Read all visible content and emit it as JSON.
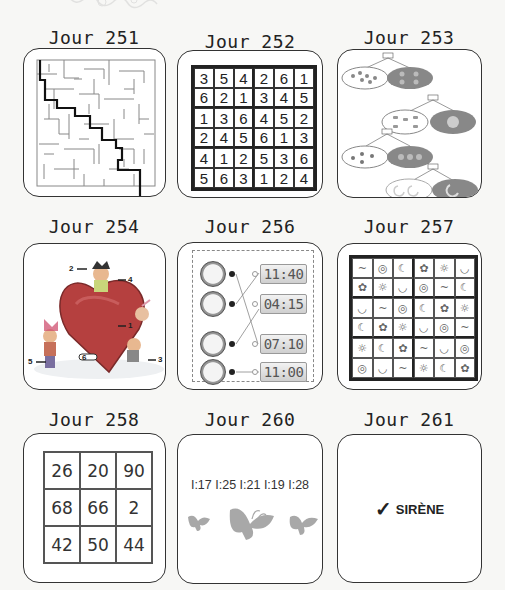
{
  "page": {
    "decoration": "swirl-ornament"
  },
  "cards": [
    {
      "title": "Jour 251",
      "type": "maze",
      "content": "maze-solution-path"
    },
    {
      "title": "Jour 252",
      "type": "sudoku",
      "grid": [
        [
          3,
          5,
          4,
          2,
          6,
          1
        ],
        [
          6,
          2,
          1,
          3,
          4,
          5
        ],
        [
          1,
          3,
          6,
          4,
          5,
          2
        ],
        [
          2,
          4,
          5,
          6,
          1,
          3
        ],
        [
          4,
          1,
          2,
          5,
          3,
          6
        ],
        [
          5,
          6,
          3,
          1,
          2,
          4
        ]
      ]
    },
    {
      "title": "Jour 253",
      "type": "counting-groups",
      "groups": [
        {
          "label": "10",
          "items": "dots"
        },
        {
          "label": "6",
          "items": "cakes"
        },
        {
          "label": "7",
          "items": "drops"
        },
        {
          "label": "3",
          "items": "moons"
        }
      ]
    },
    {
      "title": "Jour 254",
      "type": "illustration-labels",
      "labels": [
        "1",
        "2",
        "3",
        "4",
        "5",
        "6"
      ]
    },
    {
      "title": "Jour 256",
      "type": "clock-matching",
      "times": [
        "11:40",
        "04:15",
        "07:10",
        "11:00"
      ],
      "left_markers": [
        "1",
        "2",
        "3",
        "4"
      ],
      "right_markers": [
        "A",
        "B",
        "C",
        "D"
      ]
    },
    {
      "title": "Jour 257",
      "type": "symbol-sudoku",
      "grid": [
        [
          "~",
          "◎",
          "☾",
          "✿",
          "☼",
          "◡"
        ],
        [
          "✿",
          "☼",
          "◡",
          "◎",
          "~",
          "☾"
        ],
        [
          "◡",
          "~",
          "◎",
          "☾",
          "✿",
          "☼"
        ],
        [
          "☾",
          "✿",
          "☼",
          "◡",
          "◎",
          "~"
        ],
        [
          "☼",
          "☾",
          "✿",
          "~",
          "◡",
          "◎"
        ],
        [
          "◎",
          "◡",
          "~",
          "☼",
          "☾",
          "✿"
        ]
      ]
    },
    {
      "title": "Jour 258",
      "type": "number-grid",
      "grid": [
        [
          "26",
          "20",
          "90"
        ],
        [
          "68",
          "66",
          "2"
        ],
        [
          "42",
          "50",
          "44"
        ]
      ]
    },
    {
      "title": "Jour 260",
      "type": "text-butterflies",
      "text": "I:17 I:25 I:21 I:19 I:28"
    },
    {
      "title": "Jour 261",
      "type": "answer",
      "check_icon": "✓",
      "answer": "SIRÈNE"
    }
  ]
}
